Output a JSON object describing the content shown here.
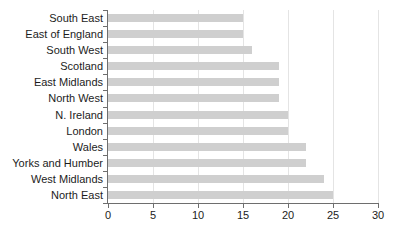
{
  "chart_data": {
    "type": "bar",
    "orientation": "horizontal",
    "title": "",
    "subtitle": "",
    "xlabel": "",
    "ylabel": "",
    "xlim": [
      0,
      30
    ],
    "xticks": [
      0,
      5,
      10,
      15,
      20,
      25,
      30
    ],
    "xtick_labels": [
      "0",
      "5",
      "10",
      "15",
      "20",
      "25",
      "30"
    ],
    "grid": "vertical",
    "legend": "none",
    "categories": [
      "South East",
      "East of England",
      "South West",
      "Scotland",
      "East Midlands",
      "North West",
      "N. Ireland",
      "London",
      "Wales",
      "Yorks and Humber",
      "West Midlands",
      "North East"
    ],
    "values": [
      15,
      15,
      16,
      19,
      19,
      19,
      20,
      20,
      22,
      22,
      24,
      25
    ],
    "bars": [
      {
        "category": "South East",
        "value": 15
      },
      {
        "category": "East of England",
        "value": 15
      },
      {
        "category": "South West",
        "value": 16
      },
      {
        "category": "Scotland",
        "value": 19
      },
      {
        "category": "East Midlands",
        "value": 19
      },
      {
        "category": "North West",
        "value": 19
      },
      {
        "category": "N. Ireland",
        "value": 20
      },
      {
        "category": "London",
        "value": 20
      },
      {
        "category": "Wales",
        "value": 22
      },
      {
        "category": "Yorks and Humber",
        "value": 22
      },
      {
        "category": "West Midlands",
        "value": 24
      },
      {
        "category": "North East",
        "value": 25
      }
    ]
  },
  "colors": {
    "bar_fill": "#cfcfcf",
    "axis": "#6e6e6e",
    "gridline": "#e4e4e4",
    "text": "#1c1c1c",
    "background": "#ffffff"
  }
}
